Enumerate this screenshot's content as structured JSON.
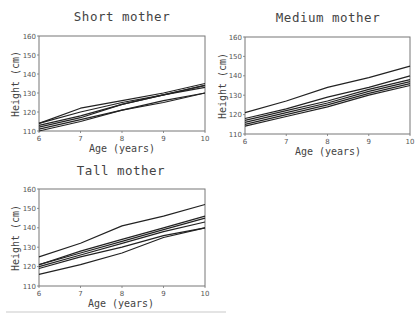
{
  "chart_data": [
    {
      "type": "line",
      "title": "Short mother",
      "xlabel": "Age (years)",
      "ylabel": "Height (cm)",
      "x": [
        6,
        7,
        8,
        9,
        10
      ],
      "xticks": [
        "6",
        "7",
        "8",
        "9",
        "10"
      ],
      "yticks": [
        "110",
        "120",
        "130",
        "140",
        "150",
        "160"
      ],
      "xlim": [
        6,
        10
      ],
      "ylim": [
        110,
        160
      ],
      "grid": false,
      "legend": null,
      "series": [
        {
          "name": "child 1",
          "values": [
            114,
            122,
            126,
            130,
            135
          ]
        },
        {
          "name": "child 2",
          "values": [
            114,
            120,
            125,
            129,
            134
          ]
        },
        {
          "name": "child 3",
          "values": [
            113,
            118,
            124,
            129,
            133
          ]
        },
        {
          "name": "child 4",
          "values": [
            112,
            117,
            124,
            129,
            134
          ]
        },
        {
          "name": "child 5",
          "values": [
            111,
            116,
            121,
            126,
            130
          ]
        },
        {
          "name": "child 6",
          "values": [
            110,
            115,
            121,
            125,
            130
          ]
        }
      ]
    },
    {
      "type": "line",
      "title": "Medium mother",
      "xlabel": "Age (years)",
      "ylabel": "Height (cm)",
      "x": [
        6,
        7,
        8,
        9,
        10
      ],
      "xticks": [
        "6",
        "7",
        "8",
        "9",
        "10"
      ],
      "yticks": [
        "110",
        "120",
        "130",
        "140",
        "150",
        "160"
      ],
      "xlim": [
        6,
        10
      ],
      "ylim": [
        110,
        160
      ],
      "grid": false,
      "legend": null,
      "series": [
        {
          "name": "child 1",
          "values": [
            121,
            127,
            134,
            139,
            145
          ]
        },
        {
          "name": "child 2",
          "values": [
            118,
            123,
            129,
            134,
            140
          ]
        },
        {
          "name": "child 3",
          "values": [
            117,
            122,
            127,
            133,
            138
          ]
        },
        {
          "name": "child 4",
          "values": [
            116,
            121,
            126,
            132,
            137
          ]
        },
        {
          "name": "child 5",
          "values": [
            115,
            120,
            125,
            131,
            136
          ]
        },
        {
          "name": "child 6",
          "values": [
            114,
            119,
            124,
            130,
            135
          ]
        }
      ]
    },
    {
      "type": "line",
      "title": "Tall mother",
      "xlabel": "Age (years)",
      "ylabel": "Height (cm)",
      "x": [
        6,
        7,
        8,
        9,
        10
      ],
      "xticks": [
        "6",
        "7",
        "8",
        "9",
        "10"
      ],
      "yticks": [
        "110",
        "120",
        "130",
        "140",
        "150",
        "160"
      ],
      "xlim": [
        6,
        10
      ],
      "ylim": [
        110,
        160
      ],
      "grid": false,
      "legend": null,
      "series": [
        {
          "name": "child 1",
          "values": [
            125,
            132,
            141,
            146,
            152
          ]
        },
        {
          "name": "child 2",
          "values": [
            121,
            128,
            134,
            140,
            146
          ]
        },
        {
          "name": "child 3",
          "values": [
            121,
            127,
            133,
            139,
            145
          ]
        },
        {
          "name": "child 4",
          "values": [
            120,
            126,
            132,
            138,
            143
          ]
        },
        {
          "name": "child 5",
          "values": [
            119,
            125,
            130,
            136,
            140
          ]
        },
        {
          "name": "child 6",
          "values": [
            116,
            121,
            127,
            135,
            140
          ]
        }
      ]
    }
  ],
  "panels": [
    {
      "title": "Short mother",
      "xlabel": "Age (years)",
      "ylabel": "Height (cm)"
    },
    {
      "title": "Medium mother",
      "xlabel": "Age (years)",
      "ylabel": "Height (cm)"
    },
    {
      "title": "Tall mother",
      "xlabel": "Age (years)",
      "ylabel": "Height (cm)"
    }
  ],
  "colors": {
    "line": "#222222",
    "frame": "#777777",
    "text": "#444444",
    "background": "#ffffff"
  }
}
